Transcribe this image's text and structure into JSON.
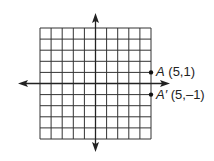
{
  "diagram": {
    "type": "coordinate-grid",
    "grid": {
      "columns": 10,
      "rows": 10,
      "x_range": [
        -5,
        5
      ],
      "y_range": [
        -5,
        5
      ]
    },
    "axes": {
      "x_arrows": true,
      "y_arrows": true
    },
    "points": [
      {
        "name": "A",
        "coords": "(5,1)",
        "x": 5,
        "y": 1
      },
      {
        "name": "A′",
        "coords": "(5,–1)",
        "x": 5,
        "y": -1
      }
    ],
    "colors": {
      "grid_line": "#333333",
      "axis": "#222222",
      "point": "#111111",
      "background": "#ffffff"
    }
  }
}
